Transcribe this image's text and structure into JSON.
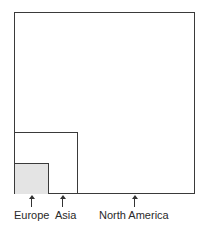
{
  "diagram": {
    "type": "nested-area-comparison",
    "regions": [
      {
        "name": "North America",
        "label": "North America",
        "fill": "none",
        "relative_size": "largest"
      },
      {
        "name": "Asia",
        "label": "Asia",
        "fill": "none",
        "relative_size": "medium"
      },
      {
        "name": "Europe",
        "label": "Europe",
        "fill": "stippled",
        "relative_size": "smallest"
      }
    ],
    "labels": {
      "europe": "Europe",
      "asia": "Asia",
      "north_america": "North America"
    },
    "colors": {
      "line": "#3a3a3a",
      "europe_fill": "#e4e4e4",
      "background": "#ffffff"
    }
  }
}
